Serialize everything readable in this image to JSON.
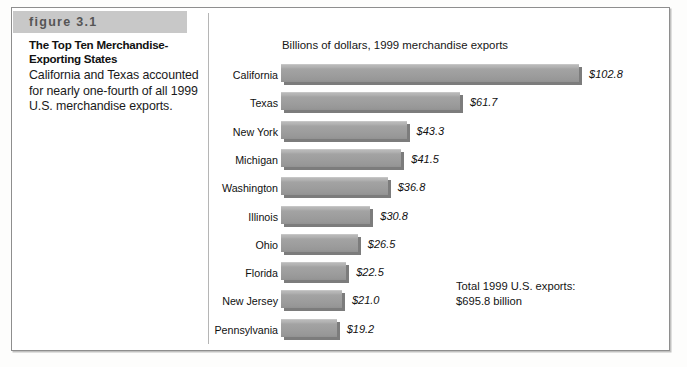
{
  "figure": {
    "banner_label": "figure 3.1",
    "title": "The Top Ten Merchandise-Exporting States",
    "body": "California and Texas accounted for nearly one-fourth of all 1999 U.S. merchandise exports."
  },
  "annotation": {
    "line1": "Total 1999 U.S. exports:",
    "line2": "$695.8 billion"
  },
  "colors": {
    "bar_fill": "#9d9d9d",
    "bar_shadow": "#7c7c7c",
    "banner": "#c8c8c8",
    "frame": "#8e8e8e",
    "text": "#111111"
  },
  "chart_data": {
    "type": "bar",
    "orientation": "horizontal",
    "title": "Billions of dollars, 1999 merchandise exports",
    "xlabel": "",
    "ylabel": "",
    "xlim": [
      0,
      110
    ],
    "grid": false,
    "legend": null,
    "categories": [
      "California",
      "Texas",
      "New York",
      "Michigan",
      "Washington",
      "Illinois",
      "Ohio",
      "Florida",
      "New Jersey",
      "Pennsylvania"
    ],
    "values": [
      102.8,
      61.7,
      43.3,
      41.5,
      36.8,
      30.8,
      26.5,
      22.5,
      21.0,
      19.2
    ],
    "value_labels": [
      "$102.8",
      "$61.7",
      "$43.3",
      "$41.5",
      "$36.8",
      "$30.8",
      "$26.5",
      "$22.5",
      "$21.0",
      "$19.2"
    ],
    "annotations": [
      "Total 1999 U.S. exports:",
      "$695.8 billion"
    ]
  }
}
